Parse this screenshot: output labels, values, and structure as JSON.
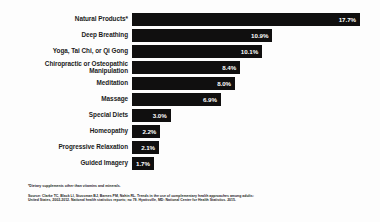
{
  "chart_data": {
    "type": "bar",
    "orientation": "horizontal",
    "title": "",
    "xlabel": "",
    "ylabel": "",
    "xlim": [
      0,
      17.7
    ],
    "grid": false,
    "legend": false,
    "value_suffix": "%",
    "categories": [
      "Natural Products*",
      "Deep Breathing",
      "Yoga, Tai Chi, or Qi Gong",
      "Chiropractic or Osteopathic\nManipulation",
      "Meditation",
      "Massage",
      "Special Diets",
      "Homeopathy",
      "Progressive Relaxation",
      "Guided Imagery"
    ],
    "values": [
      17.7,
      10.9,
      10.1,
      8.4,
      8.0,
      6.9,
      3.0,
      2.2,
      2.1,
      1.7
    ],
    "value_labels": [
      "17.7%",
      "10.9%",
      "10.1%",
      "8.4%",
      "8.0%",
      "6.9%",
      "3.0%",
      "2.2%",
      "2.1%",
      "1.7%"
    ],
    "bar_color": "#100f0f",
    "value_label_color": "#ffffff",
    "background_color": "#fdfdfd"
  },
  "footnotes": {
    "asterisk_note": "*Dietary supplements other than vitamins and minerals.",
    "source": "Source: Clarke TC, Black LI, Stussman BJ, Barnes PM, Nahin RL. Trends in the use of complementary health approaches among adults: United States, 2002-2012. National health statistics reports; no 79. Hyattsville, MD: National Center for Health Statistics. 2015."
  }
}
